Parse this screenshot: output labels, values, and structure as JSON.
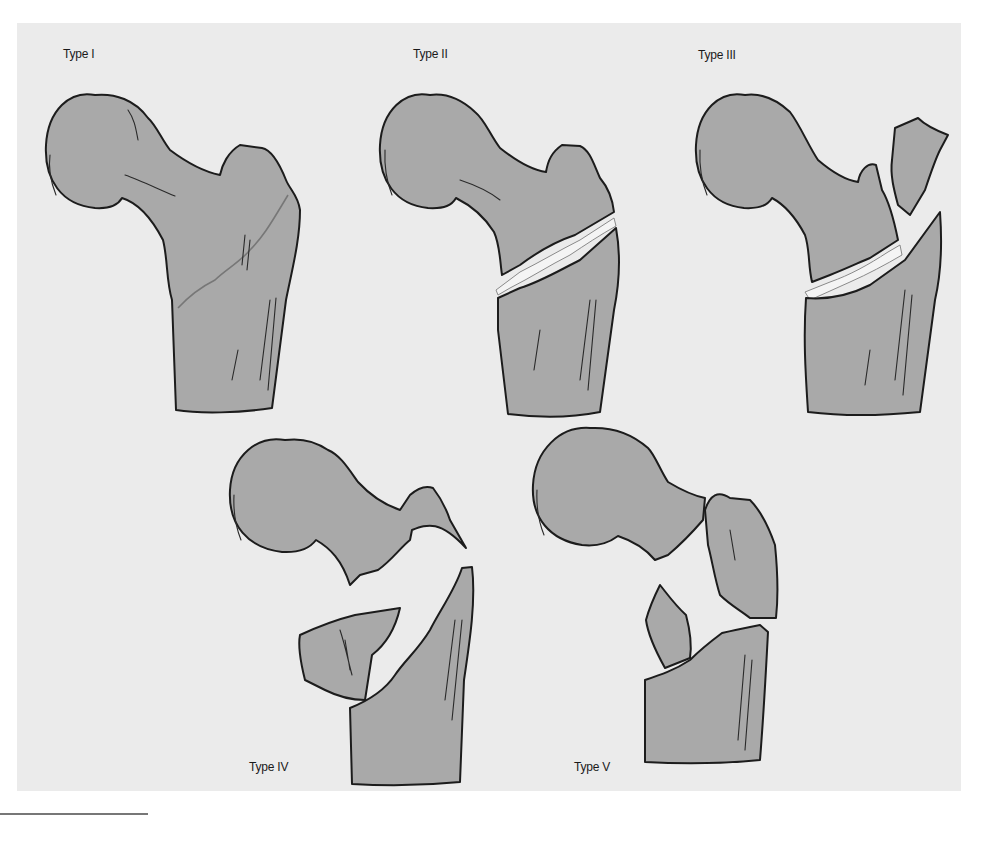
{
  "figure": {
    "background_color": "#ebebeb",
    "bone_color": "#a9a9a9",
    "outline_color": "#1c1c1c",
    "panels": [
      {
        "id": "type-1",
        "label": "Type I"
      },
      {
        "id": "type-2",
        "label": "Type II"
      },
      {
        "id": "type-3",
        "label": "Type III"
      },
      {
        "id": "type-4",
        "label": "Type IV"
      },
      {
        "id": "type-5",
        "label": "Type V"
      }
    ]
  }
}
